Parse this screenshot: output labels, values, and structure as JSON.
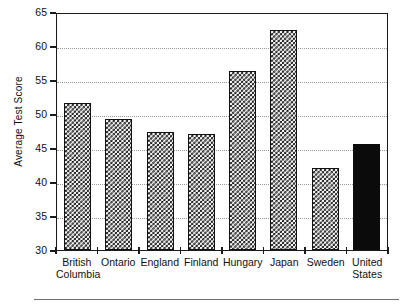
{
  "chart_data": {
    "type": "bar",
    "title": "",
    "xlabel": "",
    "ylabel": "Average Test Score",
    "ylim": [
      30,
      65
    ],
    "yticks": [
      30,
      35,
      40,
      45,
      50,
      55,
      60,
      65
    ],
    "gridlines": [
      35,
      40,
      45,
      50,
      55,
      60
    ],
    "grid": true,
    "legend": "none",
    "categories": [
      "British\nColumbia",
      "Ontario",
      "England",
      "Finland",
      "Hungary",
      "Japan",
      "Sweden",
      "United\nStates"
    ],
    "values": [
      51.6,
      49.2,
      47.4,
      47.0,
      56.3,
      62.4,
      42.1,
      45.6
    ],
    "bar_styles": [
      "checker",
      "checker",
      "checker",
      "checker",
      "checker",
      "checker",
      "checker",
      "solid-black"
    ],
    "colors": {
      "bar_pattern_fill": "#f2f2f2",
      "bar_pattern_ink": "#1a1a1a",
      "bar_solid": "#0b0b0b",
      "frame": "#1a1a1a",
      "gridline": "#9a9a9a",
      "text": "#111111"
    }
  },
  "axis": {
    "y_tick_labels": [
      "65",
      "60",
      "55",
      "50",
      "45",
      "40",
      "35",
      "30"
    ]
  }
}
